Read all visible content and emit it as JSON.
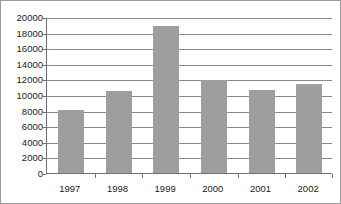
{
  "chart_data": {
    "type": "bar",
    "title": "",
    "subtitle": "",
    "xlabel": "",
    "ylabel": "",
    "categories": [
      "1997",
      "1998",
      "1999",
      "2000",
      "2001",
      "2002"
    ],
    "values": [
      8100,
      10500,
      18800,
      11900,
      10700,
      11400
    ],
    "series": [
      {
        "name": "",
        "values": [
          8100,
          10500,
          18800,
          11900,
          10700,
          11400
        ],
        "color": "#9e9e9e"
      }
    ],
    "ylim": [
      0,
      20000
    ],
    "ytick_step": 2000,
    "ytick_labels": [
      "0",
      "2000",
      "4000",
      "6000",
      "8000",
      "10000",
      "12000",
      "14000",
      "16000",
      "18000",
      "20000"
    ],
    "ytick_values": [
      0,
      2000,
      4000,
      6000,
      8000,
      10000,
      12000,
      14000,
      16000,
      18000,
      20000
    ],
    "grid": true,
    "grid_axis": "y",
    "grid_color": "#8a8a8a",
    "legend": false,
    "legend_position": "none",
    "bar_color": "#9e9e9e",
    "axis_color": "#707070",
    "background_color": "#ffffff",
    "border_color": "#9a9a9a",
    "text_color": "#1a1a1a",
    "annotations": []
  }
}
